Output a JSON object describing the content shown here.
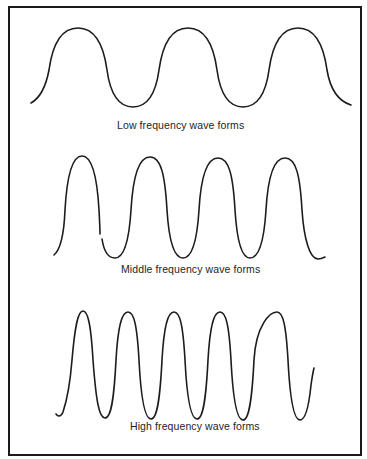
{
  "figure": {
    "panels": [
      {
        "id": "low",
        "caption": "Low frequency wave forms",
        "cycles": 3,
        "period_px": 110,
        "peak_y": 28,
        "trough_y": 107
      },
      {
        "id": "middle",
        "caption": "Middle frequency wave forms",
        "cycles": 4,
        "period_px": 67,
        "peak_y": 156,
        "trough_y": 258
      },
      {
        "id": "high",
        "caption": "High frequency wave forms",
        "cycles": 5,
        "period_px": 46,
        "peak_y": 311,
        "trough_y": 419
      }
    ],
    "colors": {
      "line": "#1c1c1c",
      "frame": "#1a1a1a",
      "background": "#ffffff"
    }
  }
}
